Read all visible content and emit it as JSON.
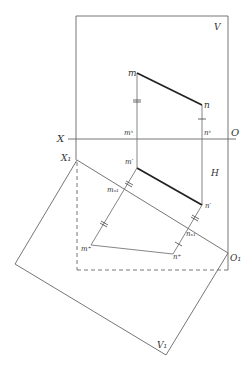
{
  "diagram": {
    "planes": {
      "V": "V",
      "H": "H",
      "V1": "V₁"
    },
    "axes": {
      "X": "X",
      "O": "O",
      "X1": "X₁",
      "O1": "O₁"
    },
    "points": {
      "m": "m",
      "n": "n",
      "m_x": "mˣ",
      "n_x": "nˣ",
      "m_prime": "m′",
      "n_prime": "n′",
      "m_x1": "mₓ₁",
      "n_x1": "nₓ₁",
      "m_plus": "m⁺",
      "n_plus": "n⁺"
    },
    "colors": {
      "line": "#555555",
      "thick_line": "#222222",
      "label": "#333333"
    }
  }
}
